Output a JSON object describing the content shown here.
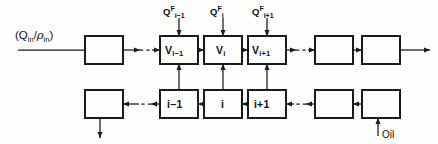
{
  "diagram": {
    "stroke_color": "#1a1a1a",
    "background_color": "#fdfdfb",
    "inlet_label": {
      "full": "(Q_in/ρ_in)",
      "open_paren": "(",
      "q_symbol": "Q",
      "q_sub": "in",
      "slash": "/",
      "rho_symbol": "ρ",
      "rho_sub": "in",
      "close_paren": ")"
    },
    "oil_label": "Oil",
    "feed_streams": [
      {
        "symbol": "Q",
        "superscript": "F",
        "subscript": "i−1"
      },
      {
        "symbol": "Q",
        "superscript": "F",
        "subscript": "i"
      },
      {
        "symbol": "Q",
        "superscript": "F",
        "subscript": "i+1"
      }
    ],
    "top_row": {
      "name": "vapor-stage-row",
      "boxes": [
        {
          "label": "",
          "labeled": false
        },
        {
          "label": "V",
          "sub": "i−1",
          "labeled": true
        },
        {
          "label": "V",
          "sub": "i",
          "labeled": true
        },
        {
          "label": "V",
          "sub": "i+1",
          "labeled": true
        },
        {
          "label": "",
          "labeled": false
        },
        {
          "label": "",
          "labeled": false
        }
      ]
    },
    "bottom_row": {
      "name": "liquid-stage-row",
      "boxes": [
        {
          "label": "",
          "labeled": false
        },
        {
          "label": "i−1",
          "labeled": true
        },
        {
          "label": "i",
          "labeled": true
        },
        {
          "label": "i+1",
          "labeled": true
        },
        {
          "label": "",
          "labeled": false
        },
        {
          "label": "",
          "labeled": false
        }
      ]
    }
  }
}
